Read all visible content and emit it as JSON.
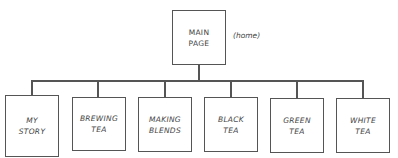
{
  "root": {
    "label": "MAIN\nPAGE",
    "note": "(home)"
  },
  "children": [
    {
      "label": "MY\nSTORY"
    },
    {
      "label": "BREWING\nTEA"
    },
    {
      "label": "MAKING\nBLENDS"
    },
    {
      "label": "BLACK\nTEA"
    },
    {
      "label": "GREEN\nTEA"
    },
    {
      "label": "WHITE\nTEA"
    }
  ],
  "colors": {
    "stroke": "#555555",
    "text": "#444444",
    "background": "#ffffff"
  }
}
